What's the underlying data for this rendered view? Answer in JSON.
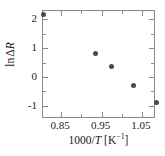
{
  "chart_data": {
    "type": "scatter",
    "title": "",
    "xlabel": "1000/T [K−1]",
    "xlabel_parts": {
      "prefix": "1000/",
      "italic": "T",
      "unit_open": " [K",
      "exponent": "−1",
      "unit_close": "]"
    },
    "ylabel": "ln ΔR",
    "ylabel_parts": {
      "prefix": "ln",
      "delta": "Δ",
      "italic": "R"
    },
    "xlim": [
      0.805,
      1.085
    ],
    "ylim": [
      -1.45,
      2.28
    ],
    "xticks": [
      0.85,
      0.95,
      1.05
    ],
    "xticklabels": [
      "0.85",
      "0.95",
      "1.05"
    ],
    "xminorticks": [
      0.9,
      1.0
    ],
    "yticks": [
      -1,
      0,
      1,
      2
    ],
    "yticklabels": [
      "-1",
      "0",
      "1",
      "2"
    ],
    "yminorticks": [
      -0.5,
      0.5,
      1.5
    ],
    "grid": false,
    "legend": null,
    "marker": {
      "shape": "circle",
      "color": "#4a4a4a",
      "size_px": 5
    },
    "frame_color": "#8a8a8a",
    "series": [
      {
        "name": "ln ΔR",
        "x": [
          0.805,
          0.935,
          0.975,
          1.03,
          1.085
        ],
        "y": [
          2.15,
          0.8,
          0.35,
          -0.3,
          -0.88
        ]
      }
    ]
  }
}
